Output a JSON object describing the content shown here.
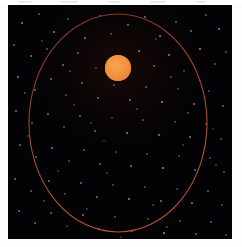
{
  "figure": {
    "kind": "astronomy-orbit-diagram",
    "panel": {
      "background_color": "#030204",
      "x": 8,
      "y": 5,
      "width": 224,
      "height": 234
    },
    "frame": {
      "background_color": "#fdfdfd"
    }
  },
  "orbit": {
    "label": "orbital-path",
    "shape": "ellipse",
    "center_x": 110,
    "center_y": 118,
    "radius_x": 89,
    "radius_y": 109,
    "stroke_color": "#9a4526",
    "stroke_color_bright": "#b5532c",
    "stroke_width": 1.1
  },
  "star": {
    "label": "central-star",
    "center_x": 110,
    "center_y": 63,
    "radius": 13,
    "fill_color": "#f0903c",
    "edge_color": "#d8762c",
    "highlight_color": "#f7a455"
  },
  "starfield": {
    "label": "background-stars",
    "count": 120,
    "colors": [
      "#ffffff",
      "#d8dcf0",
      "#f0e4d8",
      "#c8d0e8"
    ],
    "points": [
      [
        14,
        18,
        1.0,
        0.55
      ],
      [
        31,
        9,
        0.9,
        0.4
      ],
      [
        46,
        27,
        1.0,
        0.6
      ],
      [
        60,
        14,
        0.8,
        0.35
      ],
      [
        77,
        33,
        1.0,
        0.5
      ],
      [
        92,
        11,
        0.9,
        0.45
      ],
      [
        103,
        29,
        0.8,
        0.3
      ],
      [
        120,
        20,
        1.0,
        0.55
      ],
      [
        137,
        12,
        0.9,
        0.42
      ],
      [
        152,
        31,
        1.0,
        0.58
      ],
      [
        168,
        17,
        0.8,
        0.33
      ],
      [
        183,
        26,
        1.0,
        0.52
      ],
      [
        198,
        10,
        0.9,
        0.38
      ],
      [
        211,
        24,
        1.0,
        0.6
      ],
      [
        6,
        40,
        0.9,
        0.44
      ],
      [
        23,
        51,
        1.0,
        0.56
      ],
      [
        39,
        44,
        0.8,
        0.32
      ],
      [
        55,
        60,
        1.0,
        0.54
      ],
      [
        70,
        48,
        0.9,
        0.41
      ],
      [
        88,
        63,
        0.8,
        0.29
      ],
      [
        131,
        46,
        1.0,
        0.5
      ],
      [
        146,
        61,
        0.9,
        0.43
      ],
      [
        161,
        50,
        1.0,
        0.57
      ],
      [
        176,
        66,
        0.8,
        0.31
      ],
      [
        192,
        44,
        1.0,
        0.53
      ],
      [
        207,
        59,
        0.9,
        0.39
      ],
      [
        218,
        47,
        0.8,
        0.34
      ],
      [
        10,
        72,
        1.0,
        0.58
      ],
      [
        27,
        85,
        0.9,
        0.42
      ],
      [
        43,
        74,
        1.0,
        0.51
      ],
      [
        58,
        90,
        0.8,
        0.3
      ],
      [
        74,
        78,
        1.0,
        0.55
      ],
      [
        90,
        93,
        0.9,
        0.4
      ],
      [
        106,
        80,
        0.8,
        0.33
      ],
      [
        122,
        95,
        1.0,
        0.52
      ],
      [
        138,
        82,
        0.9,
        0.44
      ],
      [
        154,
        97,
        1.0,
        0.59
      ],
      [
        170,
        84,
        0.8,
        0.28
      ],
      [
        186,
        99,
        1.0,
        0.5
      ],
      [
        201,
        86,
        0.9,
        0.41
      ],
      [
        215,
        101,
        0.8,
        0.35
      ],
      [
        8,
        106,
        1.0,
        0.54
      ],
      [
        24,
        118,
        0.9,
        0.38
      ],
      [
        40,
        109,
        1.0,
        0.56
      ],
      [
        56,
        122,
        0.8,
        0.31
      ],
      [
        72,
        111,
        1.0,
        0.49
      ],
      [
        87,
        126,
        0.9,
        0.43
      ],
      [
        104,
        113,
        0.8,
        0.27
      ],
      [
        119,
        128,
        1.0,
        0.53
      ],
      [
        135,
        115,
        0.9,
        0.4
      ],
      [
        151,
        130,
        1.0,
        0.57
      ],
      [
        167,
        117,
        0.8,
        0.34
      ],
      [
        182,
        132,
        1.0,
        0.51
      ],
      [
        198,
        119,
        0.9,
        0.37
      ],
      [
        213,
        134,
        0.8,
        0.3
      ],
      [
        12,
        140,
        1.0,
        0.55
      ],
      [
        28,
        152,
        0.9,
        0.41
      ],
      [
        44,
        143,
        1.0,
        0.58
      ],
      [
        61,
        156,
        0.8,
        0.32
      ],
      [
        76,
        145,
        1.0,
        0.47
      ],
      [
        92,
        159,
        0.9,
        0.44
      ],
      [
        108,
        147,
        0.8,
        0.29
      ],
      [
        123,
        161,
        1.0,
        0.54
      ],
      [
        139,
        149,
        0.9,
        0.39
      ],
      [
        155,
        163,
        1.0,
        0.56
      ],
      [
        171,
        151,
        0.8,
        0.33
      ],
      [
        187,
        165,
        1.0,
        0.48
      ],
      [
        202,
        153,
        0.9,
        0.42
      ],
      [
        216,
        167,
        0.8,
        0.31
      ],
      [
        7,
        174,
        1.0,
        0.52
      ],
      [
        23,
        186,
        0.9,
        0.4
      ],
      [
        41,
        176,
        1.0,
        0.57
      ],
      [
        57,
        189,
        0.8,
        0.28
      ],
      [
        73,
        178,
        1.0,
        0.5
      ],
      [
        89,
        192,
        0.9,
        0.45
      ],
      [
        105,
        180,
        0.8,
        0.34
      ],
      [
        121,
        194,
        1.0,
        0.55
      ],
      [
        137,
        182,
        0.9,
        0.38
      ],
      [
        153,
        196,
        1.0,
        0.53
      ],
      [
        169,
        184,
        0.8,
        0.3
      ],
      [
        184,
        198,
        1.0,
        0.49
      ],
      [
        200,
        186,
        0.9,
        0.43
      ],
      [
        214,
        200,
        0.8,
        0.32
      ],
      [
        11,
        206,
        1.0,
        0.56
      ],
      [
        27,
        218,
        0.9,
        0.39
      ],
      [
        43,
        208,
        1.0,
        0.51
      ],
      [
        59,
        221,
        0.8,
        0.27
      ],
      [
        75,
        210,
        1.0,
        0.54
      ],
      [
        91,
        224,
        0.9,
        0.42
      ],
      [
        107,
        212,
        0.8,
        0.35
      ],
      [
        124,
        226,
        1.0,
        0.5
      ],
      [
        140,
        214,
        0.9,
        0.37
      ],
      [
        156,
        228,
        1.0,
        0.58
      ],
      [
        172,
        216,
        0.8,
        0.31
      ],
      [
        188,
        229,
        1.0,
        0.46
      ],
      [
        203,
        217,
        0.9,
        0.44
      ],
      [
        218,
        230,
        0.8,
        0.29
      ],
      [
        34,
        36,
        0.8,
        0.26
      ],
      [
        66,
        100,
        0.8,
        0.25
      ],
      [
        114,
        68,
        0.7,
        0.22
      ],
      [
        180,
        108,
        0.8,
        0.27
      ],
      [
        50,
        166,
        0.8,
        0.24
      ],
      [
        145,
        200,
        0.8,
        0.26
      ],
      [
        96,
        136,
        0.8,
        0.23
      ],
      [
        163,
        72,
        0.8,
        0.28
      ],
      [
        20,
        131,
        0.8,
        0.25
      ],
      [
        208,
        160,
        0.8,
        0.24
      ],
      [
        79,
        204,
        0.8,
        0.26
      ],
      [
        129,
        104,
        0.8,
        0.22
      ],
      [
        175,
        140,
        0.8,
        0.25
      ],
      [
        36,
        196,
        0.8,
        0.27
      ],
      [
        192,
        76,
        0.8,
        0.23
      ],
      [
        62,
        66,
        0.8,
        0.24
      ],
      [
        148,
        34,
        0.8,
        0.26
      ],
      [
        99,
        168,
        0.8,
        0.25
      ],
      [
        205,
        124,
        0.8,
        0.22
      ],
      [
        17,
        88,
        0.8,
        0.28
      ],
      [
        83,
        118,
        0.8,
        0.24
      ],
      [
        159,
        222,
        0.8,
        0.26
      ],
      [
        113,
        232,
        0.8,
        0.23
      ]
    ]
  },
  "top_artifacts": {
    "label": "scan-artifacts",
    "marks": [
      [
        18,
        14
      ],
      [
        60,
        18
      ],
      [
        108,
        12
      ],
      [
        150,
        16
      ],
      [
        196,
        10
      ]
    ]
  }
}
